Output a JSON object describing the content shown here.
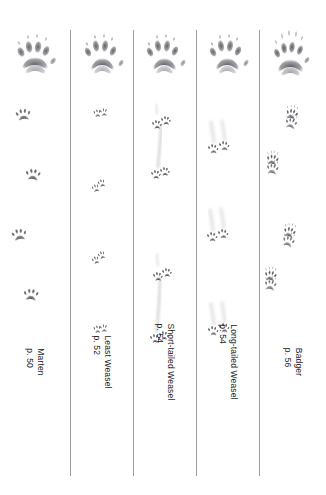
{
  "page": {
    "type": "field-guide-track-plate",
    "background_color": "#ffffff",
    "ink_color": "#4a4a4f",
    "divider_color": "#8d8d90",
    "column_count": 5
  },
  "columns": [
    {
      "id": "marten",
      "species": "Marten",
      "page_ref": "p. 50",
      "top_print": {
        "description": "single large front-foot track, five toes with claw marks, wide chevron palm pad",
        "toes": 5,
        "claws_visible": true
      },
      "trail": {
        "pattern": "alternating single tracks, loping zigzag",
        "track_count": 4,
        "drag_marks": false
      }
    },
    {
      "id": "least-weasel",
      "species": "Least Weasel",
      "page_ref": "p. 52",
      "top_print": {
        "description": "single large track, five toes with claw marks, chevron palm pad, small outer toe",
        "toes": 5,
        "claws_visible": true
      },
      "trail": {
        "pattern": "paired tracks in a straight line, 2x2 bounding",
        "track_count": 4,
        "drag_marks": false
      }
    },
    {
      "id": "short-tailed-weasel",
      "species": "Short-tailed Weasel",
      "page_ref": "p. 54",
      "top_print": {
        "description": "single large track, five toes with claw marks, chevron palm pad",
        "toes": 5,
        "claws_visible": true
      },
      "trail": {
        "pattern": "paired tracks linked by long drag/slide marks",
        "track_count": 4,
        "drag_marks": true
      }
    },
    {
      "id": "long-tailed-weasel",
      "species": "Long-tailed Weasel",
      "page_ref": "p. 54",
      "top_print": {
        "description": "single large track, five toes with claw marks, chevron palm pad",
        "toes": 5,
        "claws_visible": true
      },
      "trail": {
        "pattern": "paired tracks with trailing drag streaks, 2x2 bounding",
        "track_count": 3,
        "drag_marks": true
      }
    },
    {
      "id": "badger",
      "species": "Badger",
      "page_ref": "p. 56",
      "top_print": {
        "description": "single large track, five toes with very long claw marks well ahead of toes",
        "toes": 5,
        "claws_visible": true
      },
      "trail": {
        "pattern": "alternating overlapping front/hind pairs with long claw marks",
        "track_count": 4,
        "drag_marks": false
      }
    }
  ]
}
